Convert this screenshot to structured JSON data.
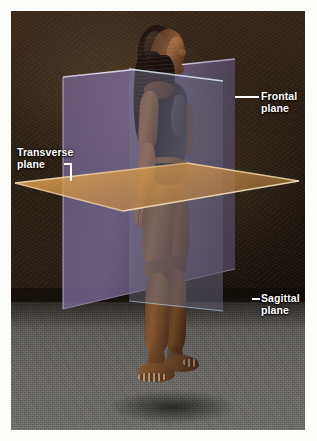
{
  "figure": {
    "view": "left lateral / oblique photographic view"
  },
  "labels": [
    {
      "id": "frontal",
      "line1": "Frontal",
      "line2": "plane",
      "full_text": "Frontal plane",
      "leader": "horizontal-rule",
      "position": "upper-right",
      "plane_color": "#7a6a95"
    },
    {
      "id": "transverse",
      "line1": "Transverse",
      "line2": "plane",
      "full_text": "Transverse plane",
      "leader": "elbow-bracket",
      "position": "left",
      "plane_color": "#d79a4c"
    },
    {
      "id": "sagittal",
      "line1": "Sagittal",
      "line2": "plane",
      "full_text": "Sagittal plane",
      "leader": "short-tick",
      "position": "lower-right",
      "plane_color": "#6a6878"
    }
  ],
  "colors": {
    "frontal_plane": "#7a6a95",
    "frontal_plane_edge": "#b9b2d6",
    "sagittal_plane": "#6a6878",
    "sagittal_plane_edge": "#9fc6d8",
    "transverse_plane": "#d79a4c",
    "transverse_plane_edge": "#f2d3a0",
    "label_text": "#ffffff",
    "mount_border": "#ffffff",
    "backdrop_dark": "#241a11",
    "floor_gray": "#5b5956",
    "skin": "#8a5b36",
    "leotard": "#181616"
  }
}
